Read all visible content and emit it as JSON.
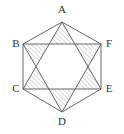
{
  "figure": {
    "canvas": {
      "width": 124,
      "height": 134
    },
    "colors": {
      "background": "#ffffff",
      "stroke": "#555555",
      "hatch": "#8a8a8a",
      "label": "#333333"
    },
    "stroke_width": 0.9,
    "hatch": {
      "pattern": "diagonal-lines",
      "direction": "lower-left-to-upper-right",
      "angle_deg": 45,
      "spacing_px": 3.2,
      "line_width": 0.6
    },
    "hexagon": {
      "name": "ABCDEF",
      "vertices": [
        {
          "label": "A",
          "x": 62,
          "y": 22,
          "label_x": 62,
          "label_y": 13,
          "label_anchor": "middle"
        },
        {
          "label": "B",
          "x": 23,
          "y": 44,
          "label_x": 16,
          "label_y": 47,
          "label_anchor": "middle"
        },
        {
          "label": "C",
          "x": 23,
          "y": 89,
          "label_x": 16,
          "label_y": 92,
          "label_anchor": "middle"
        },
        {
          "label": "D",
          "x": 62,
          "y": 112,
          "label_x": 62,
          "label_y": 125,
          "label_anchor": "middle"
        },
        {
          "label": "E",
          "x": 101,
          "y": 89,
          "label_x": 109,
          "label_y": 92,
          "label_anchor": "middle"
        },
        {
          "label": "F",
          "x": 101,
          "y": 44,
          "label_x": 109,
          "label_y": 47,
          "label_anchor": "middle"
        }
      ]
    },
    "triangles": [
      {
        "name": "triangle-ACE",
        "vertices": [
          "A",
          "C",
          "E"
        ],
        "points": "62,22 23,89 101,89"
      },
      {
        "name": "triangle-BDF",
        "vertices": [
          "B",
          "D",
          "F"
        ],
        "points": "23,44 62,112 101,44"
      }
    ],
    "inner_hexagon": {
      "name": "central-unshaded-hexagon",
      "points": "49,44 75,44 88,66.5 75,89 49,89 36,66.5"
    },
    "star_points": [
      {
        "name": "star-point-top",
        "points": "62,22 49,44 75,44"
      },
      {
        "name": "star-point-upper-left",
        "points": "23,44 49,44 36,66.5"
      },
      {
        "name": "star-point-upper-right",
        "points": "101,44 75,44 88,66.5"
      },
      {
        "name": "star-point-lower-left",
        "points": "23,89 36,66.5 49,89"
      },
      {
        "name": "star-point-lower-right",
        "points": "101,89 88,66.5 75,89"
      },
      {
        "name": "star-point-bottom",
        "points": "62,112 49,89 75,89"
      }
    ]
  }
}
